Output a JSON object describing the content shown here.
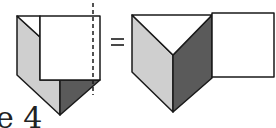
{
  "figure": {
    "caption": "e 4",
    "equals_sign": "=",
    "colors": {
      "outline": "#1a1a1a",
      "light_face": "#cfcfcf",
      "dark_face": "#5a5a5a",
      "white_face": "#ffffff"
    },
    "left_shape": {
      "description": "Folded prism with overlapping square and dashed fold line"
    },
    "right_shape": {
      "description": "Unfolded prism with adjoining square"
    }
  }
}
